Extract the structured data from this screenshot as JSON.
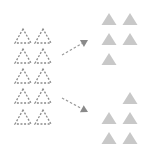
{
  "diagram": {
    "colors": {
      "outline": "#8a8a8a",
      "fill": "#c8c8c8",
      "arrow": "#9a9a9a"
    },
    "source_triangles": [
      {
        "x": 23,
        "y": 29
      },
      {
        "x": 43,
        "y": 29
      },
      {
        "x": 23,
        "y": 49
      },
      {
        "x": 43,
        "y": 49
      },
      {
        "x": 23,
        "y": 69
      },
      {
        "x": 43,
        "y": 69
      },
      {
        "x": 23,
        "y": 89
      },
      {
        "x": 43,
        "y": 89
      },
      {
        "x": 23,
        "y": 110
      },
      {
        "x": 43,
        "y": 110
      }
    ],
    "target_group_top": [
      {
        "x": 109,
        "y": 13
      },
      {
        "x": 130,
        "y": 13
      },
      {
        "x": 109,
        "y": 33
      },
      {
        "x": 130,
        "y": 33
      },
      {
        "x": 109,
        "y": 53
      }
    ],
    "target_group_bottom": [
      {
        "x": 130,
        "y": 92
      },
      {
        "x": 109,
        "y": 112
      },
      {
        "x": 130,
        "y": 112
      },
      {
        "x": 109,
        "y": 132
      },
      {
        "x": 130,
        "y": 132
      }
    ],
    "arrows": [
      {
        "from": [
          62,
          55
        ],
        "to": [
          88,
          40
        ]
      },
      {
        "from": [
          62,
          98
        ],
        "to": [
          88,
          112
        ]
      }
    ]
  }
}
